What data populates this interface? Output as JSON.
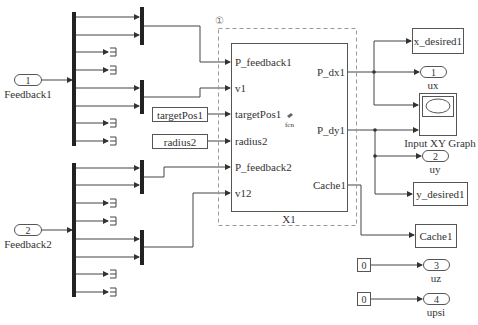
{
  "diagram": {
    "inports": [
      {
        "number": "1",
        "name": "Feedback1"
      },
      {
        "number": "2",
        "name": "Feedback2"
      }
    ],
    "subsystem": {
      "name": "X1",
      "priority_badge": "①",
      "icon_label": "fcn",
      "inputs": [
        "P_feedback1",
        "v1",
        "targetPos1",
        "radius2",
        "P_feedback2",
        "v12"
      ],
      "outputs": [
        "P_dx1",
        "P_dy1",
        "Cache1"
      ]
    },
    "from_blocks": [
      "targetPos1",
      "radius2"
    ],
    "goto_blocks": [
      "x_desired1",
      "y_desired1",
      "Cache1"
    ],
    "outports": [
      {
        "number": "1",
        "name": "ux"
      },
      {
        "number": "2",
        "name": "uy"
      },
      {
        "number": "3",
        "name": "uz"
      },
      {
        "number": "4",
        "name": "upsi"
      }
    ],
    "constants": [
      "0",
      "0"
    ],
    "scope": {
      "name": "Input XY Graph"
    },
    "colors": {
      "line": "#444444",
      "bar": "#222222",
      "dashed": "#999999"
    }
  }
}
